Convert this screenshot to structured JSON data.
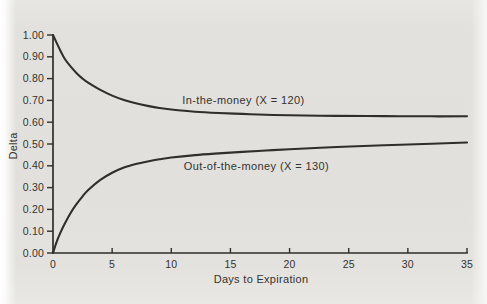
{
  "colors": {
    "background": "#e2e1dd",
    "ink": "#2f2e2b",
    "text": "#34332f"
  },
  "chart_data": {
    "type": "line",
    "title": "",
    "xlabel": "Days to Expiration",
    "ylabel": "Delta",
    "xlim": [
      0,
      35
    ],
    "ylim": [
      0.0,
      1.0
    ],
    "grid": false,
    "legend_position": "none (labels annotated next to each curve)",
    "xticks": {
      "values": [
        0,
        5,
        10,
        15,
        20,
        25,
        30,
        35
      ],
      "labels": [
        "0",
        "5",
        "10",
        "15",
        "20",
        "25",
        "30",
        "35"
      ]
    },
    "yticks": {
      "values": [
        1.0,
        0.9,
        0.8,
        0.7,
        0.6,
        0.5,
        0.4,
        0.3,
        0.2,
        0.1,
        0.0
      ],
      "labels": [
        "1.00",
        "0.90",
        "0.80",
        "0.70",
        "0.60",
        "0.50",
        "0.40",
        "0.30",
        "0.20",
        "0.10",
        "0.00"
      ]
    },
    "series": [
      {
        "name": "In-the-money (X = 120)",
        "strike": 120,
        "points": [
          [
            0,
            1.0
          ],
          [
            0.3,
            0.965
          ],
          [
            0.7,
            0.92
          ],
          [
            1,
            0.89
          ],
          [
            1.5,
            0.855
          ],
          [
            2,
            0.825
          ],
          [
            2.5,
            0.8
          ],
          [
            3,
            0.78
          ],
          [
            4,
            0.748
          ],
          [
            5,
            0.722
          ],
          [
            6,
            0.702
          ],
          [
            7,
            0.687
          ],
          [
            8,
            0.675
          ],
          [
            9,
            0.665
          ],
          [
            10,
            0.658
          ],
          [
            12,
            0.648
          ],
          [
            14,
            0.642
          ],
          [
            16,
            0.638
          ],
          [
            18,
            0.634
          ],
          [
            20,
            0.632
          ],
          [
            24,
            0.629
          ],
          [
            28,
            0.628
          ],
          [
            32,
            0.627
          ],
          [
            35,
            0.627
          ]
        ]
      },
      {
        "name": "Out-of-the-money (X = 130)",
        "strike": 130,
        "points": [
          [
            0,
            0.0
          ],
          [
            0.3,
            0.05
          ],
          [
            0.6,
            0.09
          ],
          [
            1,
            0.135
          ],
          [
            1.5,
            0.185
          ],
          [
            2,
            0.225
          ],
          [
            2.5,
            0.26
          ],
          [
            3,
            0.29
          ],
          [
            4,
            0.335
          ],
          [
            5,
            0.368
          ],
          [
            6,
            0.392
          ],
          [
            7,
            0.408
          ],
          [
            8,
            0.42
          ],
          [
            9,
            0.43
          ],
          [
            10,
            0.438
          ],
          [
            12,
            0.449
          ],
          [
            14,
            0.457
          ],
          [
            16,
            0.464
          ],
          [
            18,
            0.47
          ],
          [
            20,
            0.476
          ],
          [
            24,
            0.486
          ],
          [
            28,
            0.494
          ],
          [
            32,
            0.501
          ],
          [
            35,
            0.507
          ]
        ]
      }
    ],
    "annotations": [
      {
        "text": "In-the-money (X = 120)",
        "x": 16.1,
        "y": 0.702
      },
      {
        "text": "Out-of-the-money (X = 130)",
        "x": 17.2,
        "y": 0.399
      }
    ]
  }
}
